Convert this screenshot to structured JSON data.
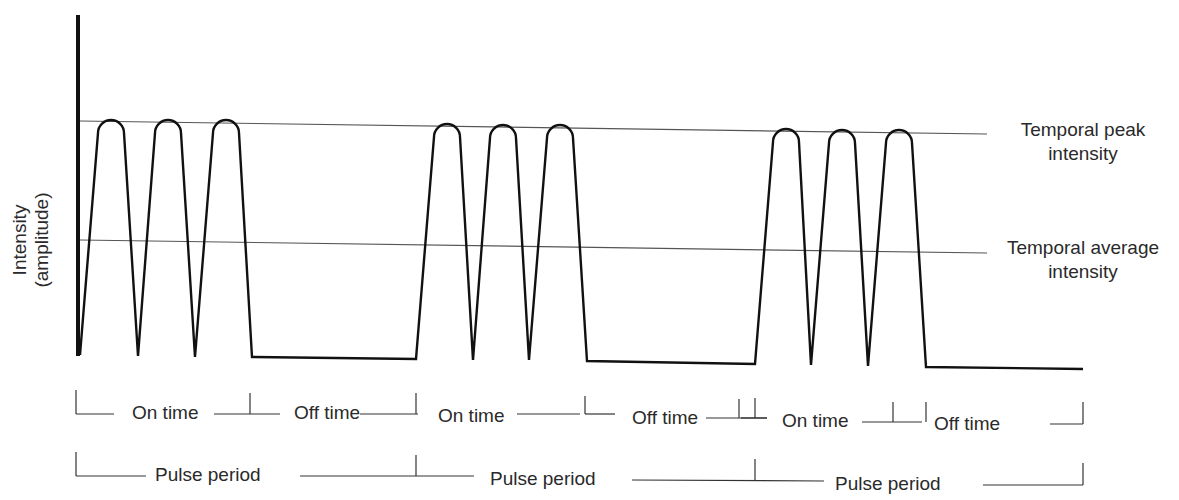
{
  "diagram": {
    "y_axis_label_line1": "Intensity",
    "y_axis_label_line2": "(amplitude)",
    "reference_lines": {
      "peak": {
        "label_line1": "Temporal peak",
        "label_line2": "intensity"
      },
      "average": {
        "label_line1": "Temporal average",
        "label_line2": "intensity"
      }
    },
    "timing_row": [
      {
        "label": "On time"
      },
      {
        "label": "Off time"
      },
      {
        "label": "On time"
      },
      {
        "label": "Off time"
      },
      {
        "label": "On time"
      },
      {
        "label": "Off time"
      }
    ],
    "period_row": [
      {
        "label": "Pulse period"
      },
      {
        "label": "Pulse period"
      },
      {
        "label": "Pulse period"
      }
    ],
    "pulse_groups": 3,
    "pulses_per_group": 3,
    "colors": {
      "waveform": "#111111",
      "reference_line": "#555555",
      "text": "#2a2a2a"
    }
  }
}
